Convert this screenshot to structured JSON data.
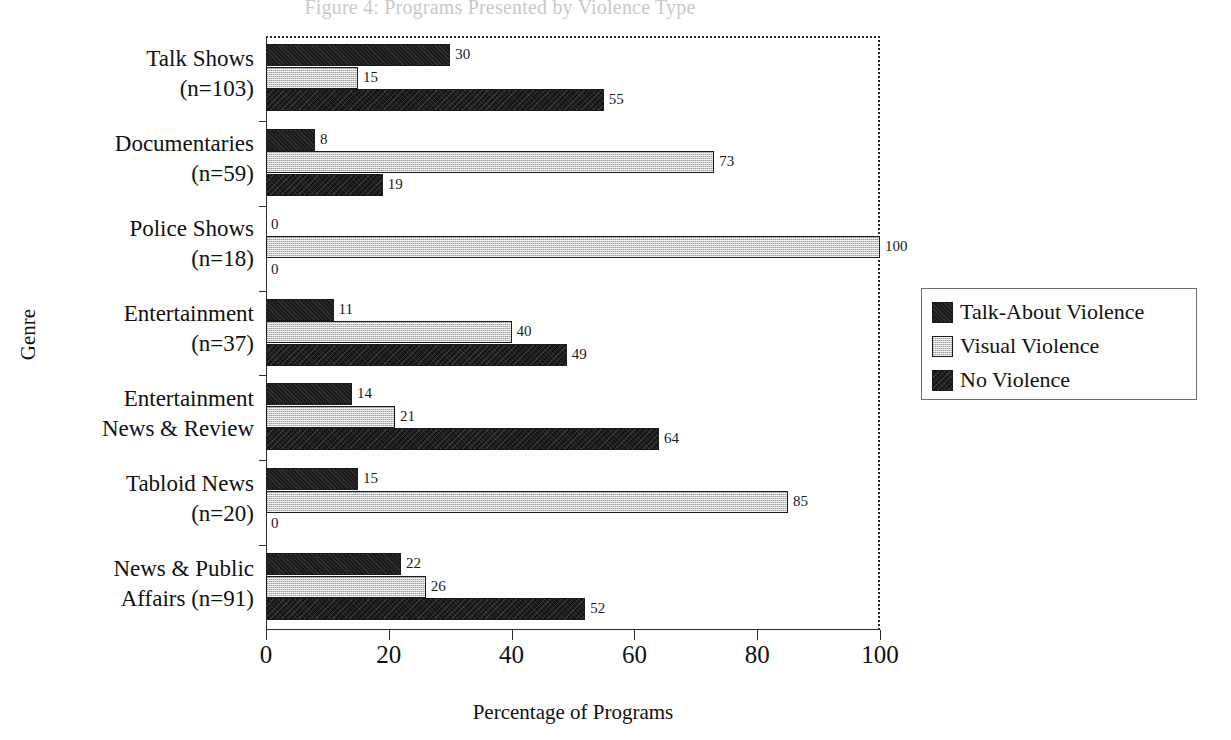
{
  "chart_data": {
    "type": "bar",
    "orientation": "horizontal",
    "title": "Figure 4: Programs Presented by Violence Type",
    "xlabel": "Percentage of Programs",
    "ylabel": "Genre",
    "xlim": [
      0,
      100
    ],
    "xticks": [
      0,
      20,
      40,
      60,
      80,
      100
    ],
    "grid": false,
    "legend_position": "right",
    "categories": [
      "Talk Shows (n=103)",
      "Documentaries (n=59)",
      "Police Shows (n=18)",
      "Entertainment (n=37)",
      "Entertainment News & Review",
      "Tabloid News (n=20)",
      "News & Public Affairs (n=91)"
    ],
    "category_lines": [
      [
        "Talk Shows",
        "(n=103)"
      ],
      [
        "Documentaries",
        "(n=59)"
      ],
      [
        "Police Shows",
        "(n=18)"
      ],
      [
        "Entertainment",
        "(n=37)"
      ],
      [
        "Entertainment",
        "News & Review"
      ],
      [
        "Tabloid News",
        "(n=20)"
      ],
      [
        "News & Public",
        "Affairs (n=91)"
      ]
    ],
    "series": [
      {
        "name": "Talk-About Violence",
        "fill": "solid-black",
        "color": "#1b1b1b",
        "values": [
          30,
          8,
          0,
          11,
          14,
          15,
          22
        ]
      },
      {
        "name": "Visual Violence",
        "fill": "light-checker",
        "color": "#c7c7c7",
        "values": [
          15,
          73,
          100,
          40,
          21,
          85,
          26
        ]
      },
      {
        "name": "No Violence",
        "fill": "dark-texture",
        "color": "#141414",
        "values": [
          55,
          19,
          0,
          49,
          64,
          0,
          52
        ]
      }
    ]
  },
  "legend": {
    "items": [
      {
        "label": "Talk-About Violence",
        "swatch": "s-talk"
      },
      {
        "label": "Visual Violence",
        "swatch": "s-visual"
      },
      {
        "label": "No Violence",
        "swatch": "s-none"
      }
    ]
  }
}
